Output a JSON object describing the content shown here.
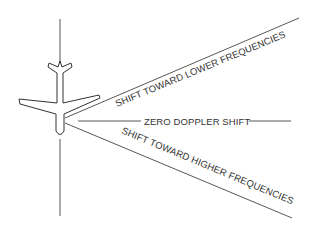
{
  "diagram": {
    "type": "doppler-beam-illustration",
    "labels": {
      "upper_beam": "SHIFT TOWARD LOWER FREQUENCIES",
      "center_beam": "ZERO DOPPLER SHIFT",
      "lower_beam": "SHIFT TOWARD HIGHER FREQUENCIES"
    },
    "elements": {
      "aircraft": "aircraft-top-view",
      "ground_track": "vertical-flight-path-line"
    },
    "colors": {
      "line": "#444444",
      "text": "#333333",
      "background": "#ffffff"
    }
  }
}
